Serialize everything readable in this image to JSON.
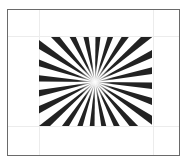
{
  "figure": {
    "type": "siemens-star",
    "ray_count": 24,
    "ray_color": "#222222",
    "background": "#ffffff",
    "frame_color": "#6a6a6a",
    "grid_color": "#ececec",
    "center": [
      95,
      82
    ],
    "clip_rect": {
      "x": 39,
      "y": 37,
      "width": 113,
      "height": 89
    },
    "grid_lines": {
      "vertical_x": [
        39,
        153
      ],
      "horizontal_y": [
        36,
        126
      ]
    }
  }
}
